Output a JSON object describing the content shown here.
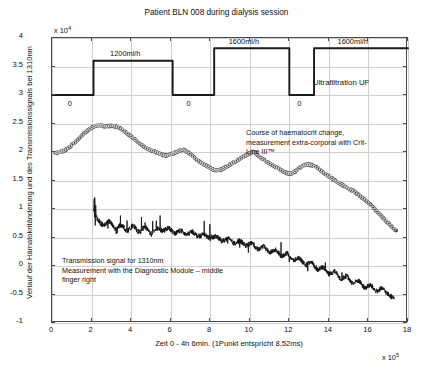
{
  "chart_data": {
    "type": "line",
    "title": "Patient BLN 008 during dialysis session",
    "xlabel": "Zeit 0 - 4h 6min. (1Punkt entspricht 8,52ms)",
    "ylabel": "Verlauf der Hämatokritänderung und des Transmissionssignals bei 1310nm",
    "x_multiplier": "x 10",
    "x_multiplier_exp": "5",
    "y_multiplier": "x 10",
    "y_multiplier_exp": "4",
    "xlim": [
      0,
      18
    ],
    "ylim": [
      -1,
      4
    ],
    "xticks": [
      0,
      2,
      4,
      6,
      8,
      10,
      12,
      14,
      16,
      18
    ],
    "yticks": [
      -1,
      -0.5,
      0,
      0.5,
      1,
      1.5,
      2,
      2.5,
      3,
      3.5,
      4
    ],
    "xtick_labels": [
      "0",
      "2",
      "4",
      "6",
      "8",
      "10",
      "12",
      "14",
      "16",
      "18"
    ],
    "ytick_labels": [
      "-1",
      "-0.5",
      "0",
      "0.5",
      "1",
      "1.5",
      "2",
      "2.5",
      "3",
      "3.5",
      "4"
    ],
    "grid": true,
    "legend": "none",
    "series": [
      {
        "name": "Ultrafiltration UF",
        "type": "step",
        "points": [
          [
            0.0,
            3.0
          ],
          [
            2.1,
            3.0
          ],
          [
            2.1,
            3.6
          ],
          [
            6.1,
            3.6
          ],
          [
            6.1,
            3.0
          ],
          [
            8.2,
            3.0
          ],
          [
            8.2,
            3.82
          ],
          [
            12.0,
            3.82
          ],
          [
            12.0,
            3.0
          ],
          [
            13.25,
            3.0
          ],
          [
            13.25,
            3.82
          ],
          [
            18.0,
            3.82
          ]
        ]
      },
      {
        "name": "Course of haematocrit change",
        "type": "line-markers",
        "x": [
          0.15,
          0.4,
          0.7,
          1.0,
          1.3,
          1.6,
          1.9,
          2.15,
          2.4,
          2.7,
          3.0,
          3.3,
          3.6,
          3.9,
          4.2,
          4.5,
          4.8,
          5.1,
          5.4,
          5.7,
          6.0,
          6.3,
          6.6,
          6.9,
          7.2,
          7.5,
          7.8,
          8.1,
          8.4,
          8.7,
          9.0,
          9.3,
          9.6,
          9.9,
          10.2,
          10.5,
          10.8,
          11.1,
          11.4,
          11.7,
          12.0,
          12.3,
          12.6,
          12.9,
          13.2,
          13.5,
          13.8,
          14.1,
          14.4,
          14.7,
          15.0,
          15.3,
          15.6,
          15.9,
          16.2,
          16.5,
          16.8,
          17.1,
          17.4
        ],
        "y": [
          1.98,
          2.0,
          2.04,
          2.12,
          2.21,
          2.32,
          2.4,
          2.45,
          2.47,
          2.45,
          2.46,
          2.44,
          2.38,
          2.3,
          2.22,
          2.14,
          2.06,
          2.02,
          1.98,
          1.94,
          1.96,
          2.0,
          2.04,
          1.99,
          1.9,
          1.82,
          1.76,
          1.7,
          1.68,
          1.72,
          1.78,
          1.84,
          1.9,
          1.96,
          2.0,
          1.92,
          1.84,
          1.78,
          1.72,
          1.66,
          1.62,
          1.66,
          1.74,
          1.78,
          1.76,
          1.7,
          1.62,
          1.55,
          1.48,
          1.42,
          1.36,
          1.3,
          1.22,
          1.14,
          1.04,
          0.93,
          0.82,
          0.72,
          0.62
        ]
      },
      {
        "name": "Transmission signal for 1310nm",
        "type": "noisy-line",
        "x": [
          2.1,
          2.3,
          2.6,
          2.9,
          3.2,
          3.5,
          3.8,
          4.1,
          4.4,
          4.7,
          5.0,
          5.3,
          5.6,
          5.9,
          6.2,
          6.5,
          6.8,
          7.1,
          7.4,
          7.7,
          8.0,
          8.3,
          8.6,
          8.9,
          9.2,
          9.5,
          9.8,
          10.1,
          10.4,
          10.7,
          11.0,
          11.3,
          11.6,
          11.9,
          12.2,
          12.5,
          12.8,
          13.1,
          13.4,
          13.7,
          14.0,
          14.3,
          14.6,
          14.9,
          15.2,
          15.5,
          15.8,
          16.1,
          16.4,
          16.7,
          17.0,
          17.3
        ],
        "y": [
          1.02,
          0.82,
          0.72,
          0.78,
          0.65,
          0.72,
          0.62,
          0.7,
          0.6,
          0.68,
          0.58,
          0.66,
          0.62,
          0.66,
          0.58,
          0.62,
          0.55,
          0.6,
          0.52,
          0.56,
          0.48,
          0.52,
          0.44,
          0.48,
          0.4,
          0.44,
          0.36,
          0.4,
          0.3,
          0.34,
          0.24,
          0.28,
          0.18,
          0.22,
          0.1,
          0.14,
          0.02,
          0.06,
          -0.06,
          -0.02,
          -0.14,
          -0.1,
          -0.22,
          -0.18,
          -0.3,
          -0.26,
          -0.38,
          -0.34,
          -0.44,
          -0.4,
          -0.5,
          -0.56
        ]
      }
    ],
    "annotations": [
      {
        "name": "haematocrit-annotation",
        "text": "Course of haematocrit change,\nmeasurement extra-corporal with Crit-\nLine III™"
      },
      {
        "name": "transmission-annotation",
        "text": "Transmission signal for 1310nm\nMeasurement with the Diagnostic Module – middle\nfinger right"
      },
      {
        "name": "ultrafiltration-label",
        "text": "Ultrafiltration UF"
      }
    ],
    "uf_rate_labels": [
      "1200ml/h",
      "1600ml/h",
      "1600ml/h"
    ],
    "uf_zero_labels": [
      "0",
      "0",
      "0"
    ],
    "colors": {
      "axis": "#4a4a4a",
      "grid": "#cfcfcf",
      "uf_line": "#1a1a1a",
      "haematocrit": "#3a3a3a",
      "transmission": "#111111",
      "text": "#111111",
      "background": "#ffffff"
    }
  }
}
